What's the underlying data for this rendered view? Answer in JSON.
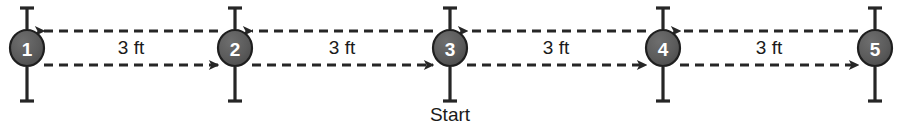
{
  "diagram": {
    "background_color": "#ffffff",
    "line_color": "#262626",
    "node_fill_color": "#5d5d5d",
    "node_stroke_color": "#1f1f1f",
    "node_label_color": "#ffffff",
    "text_color": "#1a1a1a",
    "top_line_y": 31,
    "bottom_line_y": 65,
    "node_center_y": 48,
    "node_radius_x": 17,
    "node_radius_y": 18,
    "tick_top_y": 8,
    "tick_bottom_y": 101,
    "tick_cap_half_width": 7,
    "dash_pattern": "9 6",
    "nodes": [
      {
        "id": "node-1",
        "label": "1",
        "cx": 27
      },
      {
        "id": "node-2",
        "label": "2",
        "cx": 235
      },
      {
        "id": "node-3",
        "label": "3",
        "cx": 450
      },
      {
        "id": "node-4",
        "label": "4",
        "cx": 663
      },
      {
        "id": "node-5",
        "label": "5",
        "cx": 875
      }
    ],
    "segments": [
      {
        "id": "segment-1-2",
        "from": "1",
        "to": "2",
        "label": "3 ft",
        "label_x": 131,
        "label_y": 49,
        "x_left": 44,
        "x_right": 218
      },
      {
        "id": "segment-2-3",
        "from": "2",
        "to": "3",
        "label": "3 ft",
        "label_x": 342,
        "label_y": 49,
        "x_left": 252,
        "x_right": 433
      },
      {
        "id": "segment-3-4",
        "from": "3",
        "to": "4",
        "label": "3 ft",
        "label_x": 556,
        "label_y": 49,
        "x_left": 467,
        "x_right": 646
      },
      {
        "id": "segment-4-5",
        "from": "4",
        "to": "5",
        "label": "3 ft",
        "label_x": 769,
        "label_y": 49,
        "x_left": 680,
        "x_right": 858
      }
    ],
    "top_arrow_direction": "left",
    "bottom_arrow_direction": "right",
    "start_marker": {
      "label": "Start",
      "at_node": "3",
      "x": 450,
      "y": 116
    }
  }
}
